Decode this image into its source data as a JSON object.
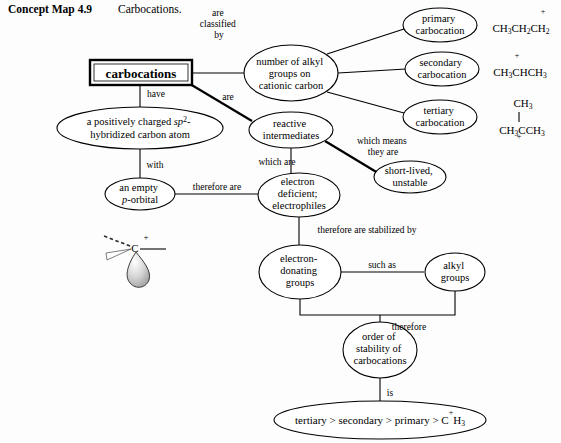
{
  "caption": {
    "label": "Concept Map 4.9",
    "title": "Carbocations."
  },
  "nodes": {
    "carbocations": "carbocations",
    "classification": "number of alkyl\ngroups on\ncationic carbon",
    "positively_charged": "a positively charged sp2-\nhybridized carbon atom",
    "reactive_intermediates": "reactive\nintermediates",
    "empty_p_orbital": "an empty\np-orbital",
    "electron_deficient": "electron\ndeficient;\nelectrophiles",
    "short_lived": "short-lived,\nunstable",
    "primary_carbocation": "primary\ncarbocation",
    "secondary_carbocation": "secondary\ncarbocation",
    "tertiary_carbocation": "tertiary\ncarbocation",
    "electron_donating": "electron-\ndonating\ngroups",
    "alkyl_groups": "alkyl\ngroups",
    "order_of_stability": "order of\nstability of\ncarbocations",
    "stability_order": "tertiary > secondary > primary > CH3"
  },
  "link_labels": {
    "are_classified_by": "are\nclassified\nby",
    "have": "have",
    "are": "are",
    "with": "with",
    "which_are": "which are",
    "which_means_they_are": "which means\nthey are",
    "therefore_are": "therefore are",
    "therefore_are_stabilized_by": "therefore are stabilized by",
    "such_as": "such as",
    "therefore": "therefore",
    "is": "is"
  },
  "formulas": {
    "primary": "CH3CH2CH2+",
    "secondary": "CH3CHCH3+",
    "tertiary_top": "CH3",
    "tertiary_bottom": "CH3CCH3+"
  },
  "orbital_diagram": {
    "atom_label": "C",
    "charge": "+"
  },
  "colors": {
    "ink": "#000000",
    "page": "#fdfdfd",
    "orbital_fill": "#b8b8b8"
  }
}
